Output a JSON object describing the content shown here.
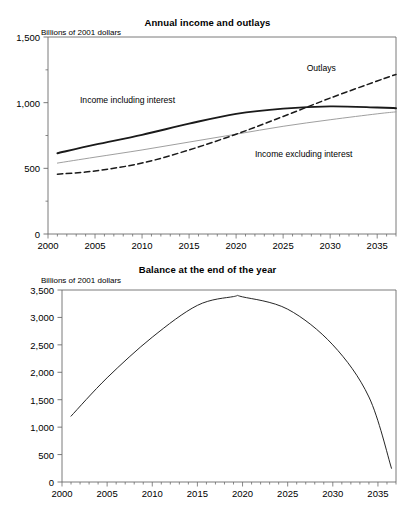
{
  "figure": {
    "background": "#ffffff",
    "axis_color": "#6b6b6b",
    "line_color_dark": "#1a1a1a",
    "line_color_light": "#9a9a9a"
  },
  "chart_data": [
    {
      "type": "line",
      "title": "Annual income and outlays",
      "ylabel": "Billions of 2001 dollars",
      "xlabel": "",
      "xlim": [
        2000,
        2037
      ],
      "ylim": [
        0,
        1500
      ],
      "yticks": [
        0,
        500,
        1000,
        1500
      ],
      "ytick_labels": [
        "0",
        "500",
        "1,000",
        "1,500"
      ],
      "xticks": [
        2000,
        2005,
        2010,
        2015,
        2020,
        2025,
        2030,
        2035
      ],
      "xtick_labels": [
        "2000",
        "2005",
        "2010",
        "2015",
        "2020",
        "2025",
        "2030",
        "2035"
      ],
      "minor_x_ticks": true,
      "minor_y_ticks": true,
      "grid": false,
      "legend": "inline-annotations",
      "x": [
        2001,
        2005,
        2010,
        2015,
        2020,
        2025,
        2030,
        2035,
        2037
      ],
      "series": [
        {
          "name": "Income including interest",
          "style": "solid-thick",
          "color": "#1a1a1a",
          "values": [
            615,
            680,
            755,
            840,
            915,
            955,
            972,
            963,
            958
          ],
          "label_x": 2003.4,
          "label_y": 1010
        },
        {
          "name": "Income excluding interest",
          "style": "solid-thin",
          "color": "#9a9a9a",
          "values": [
            540,
            585,
            640,
            700,
            760,
            820,
            870,
            915,
            930
          ],
          "label_x": 2022.0,
          "label_y": 600
        },
        {
          "name": "Outlays",
          "style": "dashed",
          "color": "#1a1a1a",
          "values": [
            455,
            480,
            540,
            640,
            760,
            895,
            1035,
            1165,
            1215
          ],
          "label_x": 2027.5,
          "label_y": 1255
        }
      ]
    },
    {
      "type": "line",
      "title": "Balance at the end of the year",
      "ylabel": "Billions of 2001 dollars",
      "xlabel": "",
      "xlim": [
        2000,
        2037
      ],
      "ylim": [
        0,
        3500
      ],
      "yticks": [
        0,
        500,
        1000,
        1500,
        2000,
        2500,
        3000,
        3500
      ],
      "ytick_labels": [
        "0",
        "500",
        "1,000",
        "1,500",
        "2,000",
        "2,500",
        "3,000",
        "3,500"
      ],
      "xticks": [
        2000,
        2005,
        2010,
        2015,
        2020,
        2025,
        2030,
        2035
      ],
      "xtick_labels": [
        "2000",
        "2005",
        "2010",
        "2015",
        "2020",
        "2025",
        "2030",
        "2035"
      ],
      "minor_x_ticks": true,
      "minor_y_ticks": false,
      "grid": false,
      "legend": "none",
      "x": [
        2001,
        2005,
        2010,
        2015,
        2019,
        2020,
        2025,
        2030,
        2034,
        2036.5
      ],
      "series": [
        {
          "name": "Balance at the end of the year",
          "style": "solid-thin",
          "color": "#1a1a1a",
          "values": [
            1200,
            1900,
            2640,
            3220,
            3380,
            3375,
            3150,
            2500,
            1550,
            250
          ]
        }
      ]
    }
  ],
  "partial_top_text": "· ·   · ·"
}
